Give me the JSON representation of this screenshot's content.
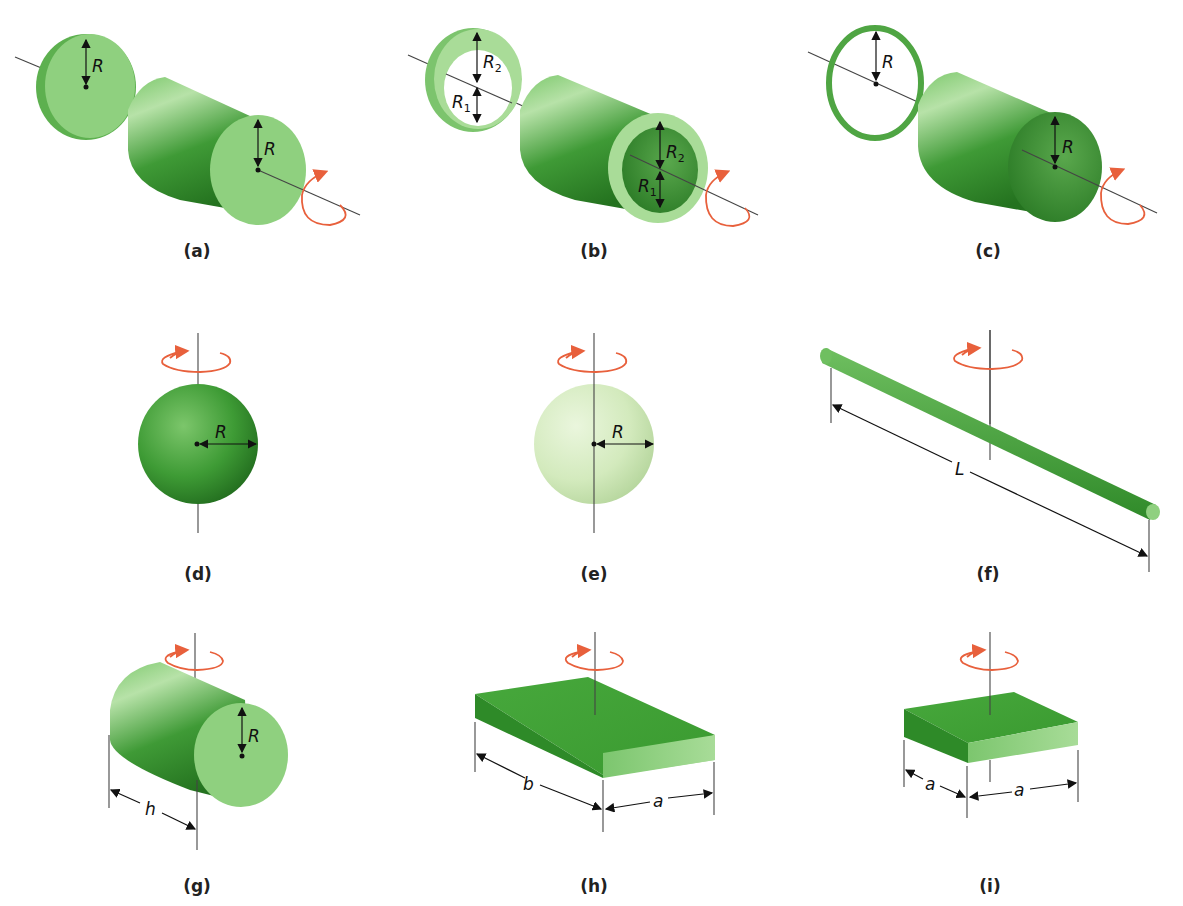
{
  "figure": {
    "colors": {
      "body_green": "#4fae42",
      "face_green": "#8fd07f",
      "dark_green": "#2e7f2a",
      "pale_green": "#d8ecc6",
      "rotation_arrow": "#e8603c",
      "dimension_line": "#111111"
    },
    "panels": [
      {
        "id": "a",
        "caption": "(a)",
        "shape": "solid cylinder / disk",
        "axis": "longitudinal",
        "labels": [
          "R",
          "R"
        ]
      },
      {
        "id": "b",
        "caption": "(b)",
        "shape": "hollow cylinder / annular ring",
        "axis": "longitudinal",
        "labels": [
          "R2",
          "R1",
          "R2",
          "R1"
        ]
      },
      {
        "id": "c",
        "caption": "(c)",
        "shape": "thin-walled hollow cylinder / hoop",
        "axis": "longitudinal",
        "labels": [
          "R",
          "R"
        ]
      },
      {
        "id": "d",
        "caption": "(d)",
        "shape": "solid sphere",
        "axis": "diameter",
        "labels": [
          "R"
        ]
      },
      {
        "id": "e",
        "caption": "(e)",
        "shape": "thin spherical shell",
        "axis": "diameter",
        "labels": [
          "R"
        ]
      },
      {
        "id": "f",
        "caption": "(f)",
        "shape": "thin rod",
        "axis": "perpendicular through center",
        "labels": [
          "L"
        ]
      },
      {
        "id": "g",
        "caption": "(g)",
        "shape": "solid cylinder",
        "axis": "transverse through center",
        "labels": [
          "R",
          "h"
        ]
      },
      {
        "id": "h",
        "caption": "(h)",
        "shape": "rectangular plate",
        "axis": "perpendicular through center",
        "labels": [
          "b",
          "a"
        ]
      },
      {
        "id": "i",
        "caption": "(i)",
        "shape": "square plate",
        "axis": "perpendicular through center",
        "labels": [
          "a",
          "a"
        ]
      }
    ],
    "symbols": {
      "R": "R",
      "R_base": "R",
      "sub1": "1",
      "sub2": "2",
      "L": "L",
      "h": "h",
      "a": "a",
      "b": "b"
    }
  }
}
